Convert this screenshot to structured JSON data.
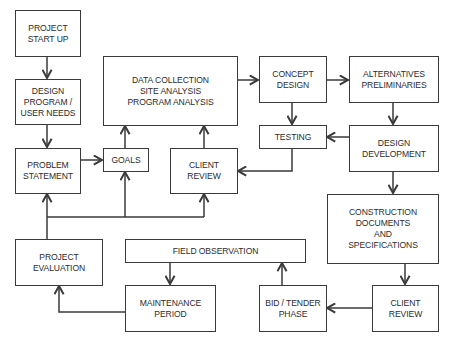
{
  "diagram": {
    "type": "flowchart",
    "title": "",
    "colors": {
      "line": "#3a3a3a",
      "text": "#2c2c2c",
      "background": "#ffffff"
    },
    "nodes": {
      "project_start_up": {
        "label": "PROJECT\nSTART UP"
      },
      "design_program": {
        "label": "DESIGN\nPROGRAM /\nUSER NEEDS"
      },
      "problem_statement": {
        "label": "PROBLEM\nSTATEMENT"
      },
      "goals": {
        "label": "GOALS"
      },
      "data_collection": {
        "label": "DATA COLLECTION\nSITE ANALYSIS\nPROGRAM ANALYSIS"
      },
      "client_review_mid": {
        "label": "CLIENT\nREVIEW"
      },
      "concept_design": {
        "label": "CONCEPT\nDESIGN"
      },
      "alternatives": {
        "label": "ALTERNATIVES\nPRELIMINARIES"
      },
      "testing": {
        "label": "TESTING"
      },
      "design_development": {
        "label": "DESIGN\nDEVELOPMENT"
      },
      "construction_documents": {
        "label": "CONSTRUCTION\nDOCUMENTS\nAND\nSPECIFICATIONS"
      },
      "project_evaluation": {
        "label": "PROJECT\nEVALUATION"
      },
      "field_observation": {
        "label": "FIELD OBSERVATION"
      },
      "maintenance_period": {
        "label": "MAINTENANCE\nPERIOD"
      },
      "bid_tender": {
        "label": "BID / TENDER\nPHASE"
      },
      "client_review_bottom": {
        "label": "CLIENT\nREVIEW"
      }
    },
    "edges": [
      {
        "from": "PROJECT START UP",
        "to": "DESIGN PROGRAM / USER NEEDS"
      },
      {
        "from": "DESIGN PROGRAM / USER NEEDS",
        "to": "PROBLEM STATEMENT"
      },
      {
        "from": "PROBLEM STATEMENT",
        "to": "GOALS"
      },
      {
        "from": "GOALS",
        "to": "DATA COLLECTION SITE ANALYSIS PROGRAM ANALYSIS"
      },
      {
        "from": "CLIENT REVIEW (mid)",
        "to": "DATA COLLECTION SITE ANALYSIS PROGRAM ANALYSIS"
      },
      {
        "from": "DATA COLLECTION SITE ANALYSIS PROGRAM ANALYSIS",
        "to": "CONCEPT DESIGN"
      },
      {
        "from": "CONCEPT DESIGN",
        "to": "ALTERNATIVES PRELIMINARIES"
      },
      {
        "from": "CONCEPT DESIGN",
        "to": "TESTING"
      },
      {
        "from": "ALTERNATIVES PRELIMINARIES",
        "to": "DESIGN DEVELOPMENT"
      },
      {
        "from": "DESIGN DEVELOPMENT",
        "to": "TESTING"
      },
      {
        "from": "TESTING",
        "to": "CLIENT REVIEW (mid)"
      },
      {
        "from": "DESIGN DEVELOPMENT",
        "to": "CONSTRUCTION DOCUMENTS AND SPECIFICATIONS"
      },
      {
        "from": "CONSTRUCTION DOCUMENTS AND SPECIFICATIONS",
        "to": "CLIENT REVIEW (bottom)"
      },
      {
        "from": "CLIENT REVIEW (bottom)",
        "to": "BID / TENDER PHASE"
      },
      {
        "from": "BID / TENDER PHASE",
        "to": "FIELD OBSERVATION"
      },
      {
        "from": "FIELD OBSERVATION",
        "to": "MAINTENANCE PERIOD"
      },
      {
        "from": "MAINTENANCE PERIOD",
        "to": "PROJECT EVALUATION"
      },
      {
        "from": "PROJECT EVALUATION",
        "to": "PROBLEM STATEMENT / GOALS / CLIENT REVIEW (feedback bus)"
      }
    ]
  }
}
